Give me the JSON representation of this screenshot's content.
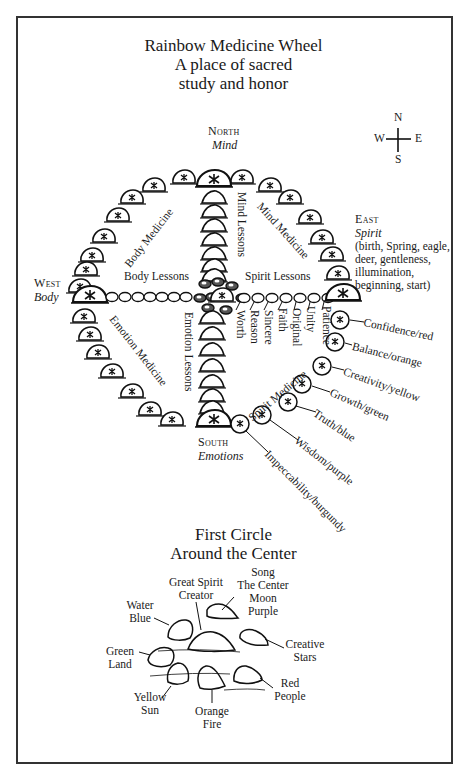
{
  "title": {
    "line1": "Rainbow Medicine Wheel",
    "line2": "A place of sacred",
    "line3": "study and honor"
  },
  "compass": {
    "n": "N",
    "e": "E",
    "s": "S",
    "w": "W"
  },
  "directions": {
    "north": {
      "name": "North",
      "meaning": "Mind"
    },
    "south": {
      "name": "South",
      "meaning": "Emotions"
    },
    "west": {
      "name": "West",
      "meaning": "Body"
    },
    "east": {
      "name": "East",
      "meaning": "Spirit",
      "details": [
        "(birth, Spring, eagle,",
        "deer, gentleness,",
        "illumination,",
        "beginning, start)"
      ]
    }
  },
  "quadrant_labels": {
    "body_medicine": "Body Medicine",
    "mind_medicine": "Mind Medicine",
    "emotion_medicine": "Emotion Medicine",
    "spirit_medicine": "Spirit Medicine",
    "body_lessons": "Body Lessons",
    "spirit_lessons": "Spirit Lessons",
    "mind_lessons": "Mind Lessons",
    "emotion_lessons": "Emotion Lessons"
  },
  "spirit_path_stones": [
    "Worth",
    "Reason",
    "Sincere",
    "Faith",
    "Original",
    "Unity",
    "Patience"
  ],
  "spirit_medicine_stones": [
    "Confidence/red",
    "Balance/orange",
    "Creativity/yellow",
    "Growth/green",
    "Truth/blue",
    "Wisdom/purple",
    "Impeccability/burgundy"
  ],
  "first_circle": {
    "title_line1": "First Circle",
    "title_line2": "Around the Center",
    "stones": {
      "great_spirit": [
        "Great Spirit",
        "Creator"
      ],
      "song": [
        "Song",
        "The Center",
        "Moon",
        "Purple"
      ],
      "water": [
        "Water",
        "Blue"
      ],
      "creative": [
        "Creative",
        "Stars"
      ],
      "green": [
        "Green",
        "Land"
      ],
      "red": [
        "Red",
        "People"
      ],
      "yellow": [
        "Yellow",
        "Sun"
      ],
      "orange": [
        "Orange",
        "Fire"
      ]
    }
  }
}
